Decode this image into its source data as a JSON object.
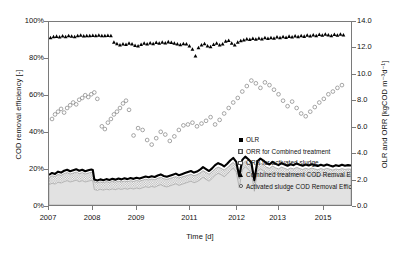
{
  "chart_data": {
    "type": "line",
    "title": "",
    "xlabel": "Time [d]",
    "ylabel_left": "COD removal efficiency [-]",
    "ylabel_right": "OLR and ORR [kgCOD m-3d-1]",
    "ylabel_right_display": "OLR and ORR [kgCOD m⁻³d⁻¹]",
    "grid": false,
    "legend_position": "center-right",
    "x_axis": {
      "tick_labels": [
        "2007",
        "2008",
        "2009",
        "2011",
        "2012",
        "2013",
        "2015"
      ],
      "tick_positions": [
        0.0,
        0.145,
        0.29,
        0.465,
        0.62,
        0.755,
        0.905
      ],
      "range_label": "2007-2015"
    },
    "y_axis_left": {
      "tick_labels": [
        "0%",
        "20%",
        "40%",
        "60%",
        "80%",
        "100%"
      ],
      "values": [
        0,
        20,
        40,
        60,
        80,
        100
      ],
      "min": 0,
      "max": 100,
      "unit": "%"
    },
    "y_axis_right": {
      "tick_labels": [
        "0.0",
        "2.0",
        "4.0",
        "6.0",
        "8.0",
        "10.0",
        "12.0",
        "14.0"
      ],
      "values": [
        0.0,
        2.0,
        4.0,
        6.0,
        8.0,
        10.0,
        12.0,
        14.0
      ],
      "min": 0.0,
      "max": 14.0,
      "unit": "kgCOD m-3 d-1"
    },
    "legend": [
      {
        "label": "OLR",
        "marker": "filled-square",
        "axis": "right"
      },
      {
        "label": "ORR for Combined treatment",
        "marker": "hatched-square",
        "axis": "right"
      },
      {
        "label": "ORR for activated sludge",
        "marker": "open-square",
        "axis": "right"
      },
      {
        "label": "Combined treatment COD Remval Efficiency (%)",
        "marker": "filled-triangle",
        "axis": "left"
      },
      {
        "label": "Activated sludge COD Removal Efficiency (%)",
        "marker": "open-circle",
        "axis": "left"
      }
    ],
    "series": [
      {
        "name": "Combined treatment COD Remval Efficiency (%)",
        "marker": "filled-triangle",
        "axis": "left",
        "unit": "%",
        "x": [
          0.005,
          0.015,
          0.025,
          0.035,
          0.045,
          0.055,
          0.065,
          0.075,
          0.085,
          0.095,
          0.105,
          0.115,
          0.125,
          0.135,
          0.145,
          0.155,
          0.165,
          0.175,
          0.185,
          0.195,
          0.205,
          0.215,
          0.225,
          0.235,
          0.245,
          0.255,
          0.265,
          0.275,
          0.285,
          0.295,
          0.305,
          0.315,
          0.325,
          0.335,
          0.345,
          0.355,
          0.365,
          0.375,
          0.385,
          0.395,
          0.405,
          0.415,
          0.425,
          0.435,
          0.445,
          0.455,
          0.465,
          0.475,
          0.485,
          0.495,
          0.505,
          0.515,
          0.525,
          0.535,
          0.545,
          0.555,
          0.565,
          0.575,
          0.585,
          0.595,
          0.605,
          0.615,
          0.625,
          0.635,
          0.645,
          0.655,
          0.665,
          0.675,
          0.685,
          0.695,
          0.705,
          0.715,
          0.725,
          0.735,
          0.745,
          0.755,
          0.765,
          0.775,
          0.785,
          0.795,
          0.805,
          0.815,
          0.825,
          0.835,
          0.845,
          0.855,
          0.865,
          0.875,
          0.885,
          0.895,
          0.905,
          0.915,
          0.925,
          0.935,
          0.945,
          0.955,
          0.965,
          0.975
        ],
        "y": [
          91.5,
          92.0,
          92.2,
          91.8,
          92.4,
          92.0,
          92.6,
          92.3,
          92.0,
          92.5,
          92.8,
          92.4,
          92.6,
          92.5,
          92.7,
          92.6,
          92.8,
          92.5,
          92.6,
          92.7,
          92.5,
          89.0,
          88.2,
          87.5,
          88.0,
          87.8,
          88.5,
          88.0,
          87.2,
          87.0,
          87.8,
          88.4,
          88.0,
          88.6,
          88.2,
          88.8,
          88.4,
          89.0,
          88.6,
          89.2,
          88.8,
          88.4,
          88.0,
          87.6,
          88.2,
          88.0,
          87.0,
          85.2,
          81.5,
          86.0,
          87.5,
          88.2,
          87.0,
          86.5,
          87.8,
          88.5,
          87.5,
          88.0,
          89.5,
          90.0,
          88.5,
          87.5,
          89.0,
          89.8,
          90.2,
          90.8,
          90.5,
          91.0,
          90.6,
          91.2,
          90.8,
          91.4,
          91.0,
          91.5,
          91.2,
          91.8,
          91.4,
          92.0,
          91.6,
          92.2,
          91.8,
          92.4,
          92.0,
          92.6,
          92.2,
          92.8,
          92.4,
          93.0,
          92.5,
          93.2,
          92.8,
          93.4,
          93.0,
          92.6,
          93.2,
          92.8,
          93.4,
          93.0
        ]
      },
      {
        "name": "Activated sludge COD Removal Efficiency (%)",
        "marker": "open-circle",
        "axis": "left",
        "unit": "%",
        "x": [
          0.01,
          0.02,
          0.03,
          0.04,
          0.05,
          0.06,
          0.07,
          0.08,
          0.09,
          0.1,
          0.11,
          0.12,
          0.13,
          0.14,
          0.15,
          0.16,
          0.175,
          0.185,
          0.195,
          0.205,
          0.215,
          0.225,
          0.235,
          0.245,
          0.255,
          0.265,
          0.28,
          0.295,
          0.31,
          0.325,
          0.34,
          0.355,
          0.37,
          0.385,
          0.4,
          0.415,
          0.43,
          0.445,
          0.46,
          0.475,
          0.49,
          0.505,
          0.52,
          0.535,
          0.55,
          0.565,
          0.58,
          0.595,
          0.61,
          0.625,
          0.64,
          0.655,
          0.67,
          0.685,
          0.7,
          0.715,
          0.73,
          0.745,
          0.76,
          0.775,
          0.79,
          0.805,
          0.82,
          0.835,
          0.85,
          0.865,
          0.88,
          0.895,
          0.91,
          0.925,
          0.94,
          0.955,
          0.97
        ],
        "y": [
          47.0,
          49.5,
          51.0,
          52.5,
          50.5,
          53.0,
          54.5,
          56.0,
          55.0,
          57.5,
          58.5,
          60.0,
          59.0,
          60.5,
          61.5,
          58.0,
          43.0,
          41.5,
          45.0,
          47.0,
          49.5,
          51.0,
          53.0,
          55.5,
          57.0,
          52.0,
          38.0,
          42.0,
          41.0,
          35.5,
          33.0,
          36.5,
          40.0,
          38.5,
          35.0,
          37.5,
          41.0,
          43.5,
          44.0,
          45.0,
          43.0,
          44.5,
          46.0,
          48.0,
          44.0,
          46.5,
          50.0,
          53.0,
          56.0,
          58.5,
          62.0,
          65.0,
          68.0,
          66.5,
          64.0,
          67.0,
          65.5,
          63.0,
          60.5,
          57.0,
          54.0,
          56.5,
          53.0,
          50.0,
          48.5,
          51.0,
          53.5,
          56.0,
          58.0,
          60.5,
          62.0,
          64.0,
          65.5
        ]
      },
      {
        "name": "OLR",
        "marker": "filled-square-line",
        "axis": "right",
        "unit": "kgCOD m-3 d-1",
        "x": [
          0.0,
          0.01,
          0.02,
          0.03,
          0.04,
          0.05,
          0.06,
          0.07,
          0.08,
          0.09,
          0.1,
          0.11,
          0.12,
          0.13,
          0.14,
          0.145,
          0.15,
          0.16,
          0.17,
          0.18,
          0.19,
          0.2,
          0.21,
          0.22,
          0.23,
          0.24,
          0.25,
          0.26,
          0.27,
          0.28,
          0.29,
          0.3,
          0.31,
          0.32,
          0.33,
          0.34,
          0.35,
          0.36,
          0.37,
          0.38,
          0.39,
          0.4,
          0.41,
          0.42,
          0.43,
          0.44,
          0.45,
          0.46,
          0.47,
          0.48,
          0.49,
          0.5,
          0.51,
          0.52,
          0.53,
          0.54,
          0.55,
          0.56,
          0.57,
          0.58,
          0.59,
          0.6,
          0.61,
          0.62,
          0.63,
          0.64,
          0.65,
          0.66,
          0.67,
          0.68,
          0.69,
          0.7,
          0.71,
          0.72,
          0.73,
          0.74,
          0.75,
          0.76,
          0.77,
          0.78,
          0.79,
          0.8,
          0.81,
          0.82,
          0.83,
          0.84,
          0.85,
          0.86,
          0.87,
          0.88,
          0.89,
          0.9,
          0.91,
          0.92,
          0.93,
          0.94,
          0.95,
          0.96,
          0.97,
          0.98,
          0.99,
          1.0
        ],
        "y": [
          2.3,
          2.45,
          2.38,
          2.55,
          2.48,
          2.62,
          2.7,
          2.58,
          2.66,
          2.74,
          2.62,
          2.7,
          2.58,
          2.66,
          2.72,
          2.68,
          1.95,
          1.88,
          1.96,
          1.9,
          1.98,
          1.92,
          2.0,
          1.94,
          2.02,
          1.96,
          2.04,
          1.98,
          2.06,
          2.0,
          2.08,
          2.02,
          2.1,
          2.18,
          2.12,
          2.2,
          2.14,
          2.26,
          2.34,
          2.22,
          2.16,
          2.24,
          2.32,
          2.4,
          2.28,
          2.36,
          2.44,
          2.52,
          2.6,
          2.48,
          2.56,
          2.7,
          2.9,
          2.75,
          2.6,
          2.8,
          3.05,
          3.2,
          3.1,
          2.95,
          3.15,
          3.4,
          3.6,
          3.3,
          2.2,
          3.45,
          3.7,
          3.5,
          3.25,
          1.9,
          3.35,
          3.55,
          3.4,
          3.2,
          3.1,
          3.3,
          3.15,
          3.05,
          3.2,
          3.1,
          3.0,
          3.12,
          3.05,
          3.18,
          3.08,
          3.0,
          3.1,
          3.02,
          3.12,
          3.05,
          2.98,
          3.08,
          3.0,
          3.1,
          3.02,
          2.95,
          3.05,
          2.98,
          3.08,
          3.0,
          3.05,
          3.02
        ]
      },
      {
        "name": "ORR for Combined treatment",
        "marker": "hatched-area",
        "axis": "right",
        "unit": "kgCOD m-3 d-1",
        "note": "upper boundary of hatched band; lies just below OLR line",
        "x": [
          0.0,
          0.01,
          0.02,
          0.03,
          0.04,
          0.05,
          0.06,
          0.07,
          0.08,
          0.09,
          0.1,
          0.11,
          0.12,
          0.13,
          0.14,
          0.145,
          0.15,
          0.16,
          0.17,
          0.18,
          0.19,
          0.2,
          0.21,
          0.22,
          0.23,
          0.24,
          0.25,
          0.26,
          0.27,
          0.28,
          0.29,
          0.3,
          0.31,
          0.32,
          0.33,
          0.34,
          0.35,
          0.36,
          0.37,
          0.38,
          0.39,
          0.4,
          0.41,
          0.42,
          0.43,
          0.44,
          0.45,
          0.46,
          0.47,
          0.48,
          0.49,
          0.5,
          0.51,
          0.52,
          0.53,
          0.54,
          0.55,
          0.56,
          0.57,
          0.58,
          0.59,
          0.6,
          0.61,
          0.62,
          0.63,
          0.64,
          0.65,
          0.66,
          0.67,
          0.68,
          0.69,
          0.7,
          0.71,
          0.72,
          0.73,
          0.74,
          0.75,
          0.76,
          0.77,
          0.78,
          0.79,
          0.8,
          0.81,
          0.82,
          0.83,
          0.84,
          0.85,
          0.86,
          0.87,
          0.88,
          0.89,
          0.9,
          0.91,
          0.92,
          0.93,
          0.94,
          0.95,
          0.96,
          0.97,
          0.98,
          0.99,
          1.0
        ],
        "y": [
          2.1,
          2.24,
          2.18,
          2.34,
          2.27,
          2.4,
          2.48,
          2.37,
          2.44,
          2.52,
          2.4,
          2.48,
          2.37,
          2.44,
          2.5,
          2.46,
          1.76,
          1.7,
          1.77,
          1.72,
          1.79,
          1.74,
          1.81,
          1.75,
          1.83,
          1.77,
          1.84,
          1.79,
          1.86,
          1.81,
          1.88,
          1.83,
          1.9,
          1.97,
          1.92,
          1.99,
          1.94,
          2.04,
          2.12,
          2.01,
          1.96,
          2.03,
          2.1,
          2.17,
          2.06,
          2.14,
          2.21,
          2.28,
          2.35,
          2.24,
          2.32,
          2.45,
          2.63,
          2.49,
          2.36,
          2.54,
          2.77,
          2.9,
          2.81,
          2.67,
          2.86,
          3.08,
          3.26,
          2.99,
          1.98,
          3.13,
          3.35,
          3.17,
          2.94,
          1.7,
          3.03,
          3.21,
          3.08,
          2.9,
          2.81,
          2.99,
          2.85,
          2.76,
          2.9,
          2.81,
          2.72,
          2.83,
          2.76,
          2.88,
          2.79,
          2.72,
          2.81,
          2.74,
          2.83,
          2.76,
          2.7,
          2.79,
          2.72,
          2.81,
          2.74,
          2.67,
          2.76,
          2.7,
          2.79,
          2.72,
          2.76,
          2.74
        ]
      },
      {
        "name": "ORR for activated sludge",
        "marker": "open-area",
        "axis": "right",
        "unit": "kgCOD m-3 d-1",
        "note": "upper boundary of light grey lower band",
        "x": [
          0.0,
          0.01,
          0.02,
          0.03,
          0.04,
          0.05,
          0.06,
          0.07,
          0.08,
          0.09,
          0.1,
          0.11,
          0.12,
          0.13,
          0.14,
          0.145,
          0.15,
          0.16,
          0.17,
          0.18,
          0.19,
          0.2,
          0.21,
          0.22,
          0.23,
          0.24,
          0.25,
          0.26,
          0.27,
          0.28,
          0.29,
          0.3,
          0.31,
          0.32,
          0.33,
          0.34,
          0.35,
          0.36,
          0.37,
          0.38,
          0.39,
          0.4,
          0.41,
          0.42,
          0.43,
          0.44,
          0.45,
          0.46,
          0.47,
          0.48,
          0.49,
          0.5,
          0.51,
          0.52,
          0.53,
          0.54,
          0.55,
          0.56,
          0.57,
          0.58,
          0.59,
          0.6,
          0.61,
          0.62,
          0.63,
          0.64,
          0.65,
          0.66,
          0.67,
          0.68,
          0.69,
          0.7,
          0.71,
          0.72,
          0.73,
          0.74,
          0.75,
          0.76,
          0.77,
          0.78,
          0.79,
          0.8,
          0.81,
          0.82,
          0.83,
          0.84,
          0.85,
          0.86,
          0.87,
          0.88,
          0.89,
          0.9,
          0.91,
          0.92,
          0.93,
          0.94,
          0.95,
          0.96,
          0.97,
          0.98,
          0.99,
          1.0
        ],
        "y": [
          1.55,
          1.66,
          1.6,
          1.74,
          1.68,
          1.78,
          1.86,
          1.76,
          1.82,
          1.9,
          1.78,
          1.86,
          1.76,
          1.82,
          1.88,
          1.84,
          1.18,
          1.12,
          1.2,
          1.14,
          1.21,
          1.16,
          1.23,
          1.17,
          1.25,
          1.19,
          1.26,
          1.21,
          1.28,
          1.22,
          1.3,
          1.24,
          1.32,
          1.4,
          1.34,
          1.42,
          1.36,
          1.47,
          1.56,
          1.44,
          1.38,
          1.46,
          1.54,
          1.62,
          1.5,
          1.58,
          1.66,
          1.74,
          1.82,
          1.7,
          1.78,
          1.92,
          2.12,
          1.96,
          1.82,
          2.02,
          2.28,
          2.42,
          2.32,
          2.16,
          2.36,
          2.62,
          2.82,
          2.52,
          1.3,
          2.68,
          2.92,
          2.72,
          2.46,
          1.05,
          2.56,
          2.76,
          2.62,
          2.42,
          2.32,
          2.52,
          2.38,
          2.28,
          2.42,
          2.32,
          2.22,
          2.34,
          2.26,
          2.4,
          2.3,
          2.22,
          2.32,
          2.24,
          2.34,
          2.26,
          2.18,
          2.28,
          2.2,
          2.3,
          2.22,
          2.14,
          2.24,
          2.18,
          2.28,
          2.2,
          2.24,
          2.22
        ]
      }
    ]
  }
}
